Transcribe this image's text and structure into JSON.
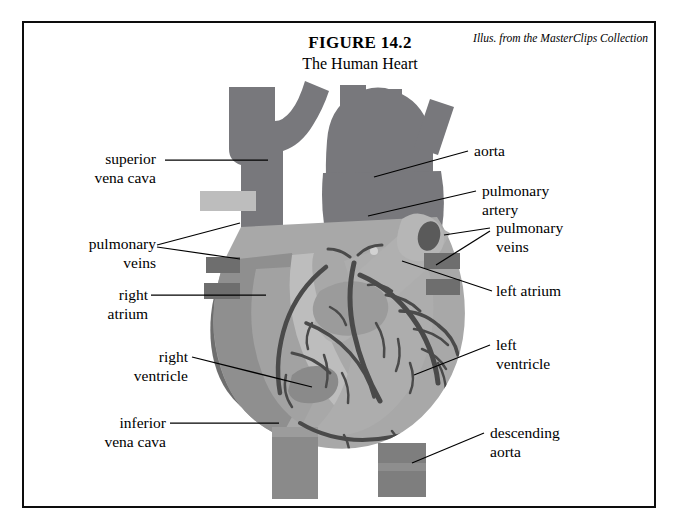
{
  "figure": {
    "number": "FIGURE 14.2",
    "subtitle": "The Human Heart",
    "attribution": "Illus. from the MasterClips Collection"
  },
  "labels": {
    "superior_vena_cava": "superior\nvena cava",
    "pulmonary_veins_left": "pulmonary\nveins",
    "right_atrium": "right\natrium",
    "right_ventricle": "right\nventricle",
    "inferior_vena_cava": "inferior\nvena cava",
    "aorta": "aorta",
    "pulmonary_artery": "pulmonary\nartery",
    "pulmonary_veins_right": "pulmonary\nveins",
    "left_atrium": "left atrium",
    "left_ventricle": "left\nventricle",
    "descending_aorta": "descending\naorta"
  },
  "colors": {
    "background": "#ffffff",
    "frame": "#0d0d0d",
    "vessel_dark": "#78787c",
    "atrium_dark": "#6e6e6e",
    "myocardium_mid": "#8f8f8f",
    "ventricle_light": "#a8a8a8",
    "highlight_pale": "#bdbdbd",
    "pulmonary_artery": "#b0b0b0",
    "coronary_vessel": "#4a4a4a",
    "lumen_shadow": "#5a5a5a"
  }
}
